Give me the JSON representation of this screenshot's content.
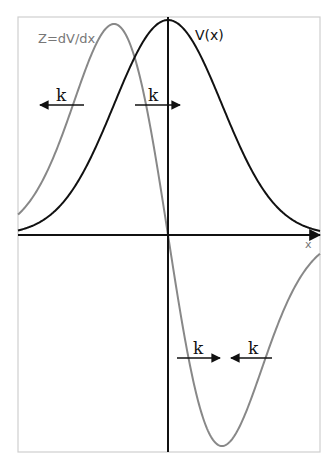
{
  "diagram": {
    "title": "",
    "curves": [
      {
        "id": "V",
        "label": "V(x)",
        "description": "Gaussian-like potential centered at origin",
        "color": "#111111"
      },
      {
        "id": "Z",
        "label": "Z=dV/dx",
        "description": "Derivative of V (positive peak left of origin, negative trough right of origin)",
        "color": "#888888"
      }
    ],
    "axes": {
      "x_label": "x"
    },
    "arrows": [
      {
        "label": "k",
        "direction": "left",
        "region": "upper-left"
      },
      {
        "label": "k",
        "direction": "right",
        "region": "upper-center"
      },
      {
        "label": "k",
        "direction": "right",
        "region": "lower-center"
      },
      {
        "label": "k",
        "direction": "left",
        "region": "lower-right"
      }
    ],
    "colors": {
      "frame": "#cfcfcf",
      "axis": "#111111",
      "v_curve": "#111111",
      "z_curve": "#888888",
      "z_label": "#777777",
      "x_label": "#777777"
    }
  }
}
